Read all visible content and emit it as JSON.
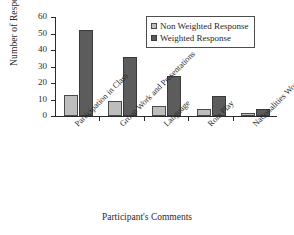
{
  "chart_data": {
    "type": "bar",
    "title": "",
    "xlabel": "Participant's Comments",
    "ylabel": "Number of Responses",
    "categories": [
      "Participation in Class",
      "Group Work and Presentations",
      "Language",
      "Role Play",
      "Nationalities Working Together"
    ],
    "series": [
      {
        "name": "Non Weighted Response",
        "color": "#bdbdbd",
        "values": [
          13,
          9,
          6,
          4,
          2
        ]
      },
      {
        "name": "Weighted Response",
        "color": "#5c5c5c",
        "values": [
          52,
          36,
          24,
          12,
          4
        ]
      }
    ],
    "ylim": [
      0,
      60
    ],
    "ytick_labels": [
      "0",
      "10",
      "20",
      "30",
      "40",
      "50",
      "60"
    ],
    "ytick_values": [
      0,
      10,
      20,
      30,
      40,
      50,
      60
    ],
    "grid": false,
    "legend_position": "top-right"
  },
  "legend": {
    "entries": [
      {
        "label": "Non Weighted Response"
      },
      {
        "label": "Weighted Response"
      }
    ]
  }
}
